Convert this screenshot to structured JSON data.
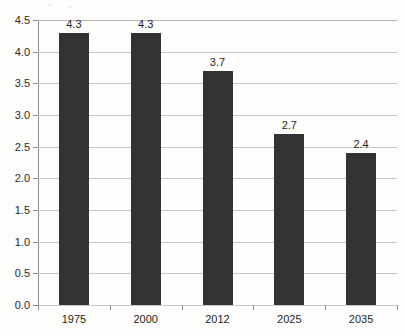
{
  "chart_data": {
    "type": "bar",
    "title": "",
    "subtitle": "",
    "xlabel": "",
    "ylabel": "",
    "categories": [
      "1975",
      "2000",
      "2012",
      "2025",
      "2035"
    ],
    "values": [
      4.3,
      4.3,
      3.7,
      2.7,
      2.4
    ],
    "value_labels": [
      "4.3",
      "4.3",
      "3.7",
      "2.7",
      "2.4"
    ],
    "series": [
      {
        "name": "",
        "values": [
          4.3,
          4.3,
          3.7,
          2.7,
          2.4
        ]
      }
    ],
    "ylim": [
      0.0,
      4.5
    ],
    "ytick_values": [
      0.0,
      0.5,
      1.0,
      1.5,
      2.0,
      2.5,
      3.0,
      3.5,
      4.0,
      4.5
    ],
    "ytick_labels": [
      "0.0",
      "0.5",
      "1.0",
      "1.5",
      "2.0",
      "2.5",
      "3.0",
      "3.5",
      "4.0",
      "4.5"
    ],
    "grid": true,
    "grid_axis": "y",
    "legend": false,
    "legend_position": "none",
    "annotations": [],
    "bar_color": "#333333",
    "background_color": "#fdfdfb",
    "gridline_color": "#c7c7c4",
    "axis_color": "#8e8e8b",
    "text_color": "#1f1f1f"
  }
}
